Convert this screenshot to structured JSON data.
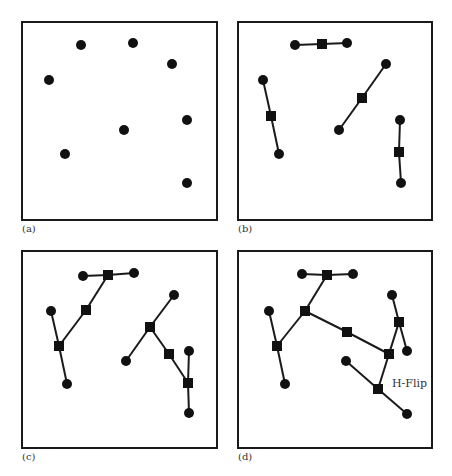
{
  "figure": {
    "panels": [
      {
        "id": "a",
        "label": "(a)",
        "box": [
          22,
          22,
          217,
          220
        ],
        "label_pos": [
          22,
          232
        ],
        "circles": [
          [
            81,
            45
          ],
          [
            133,
            43
          ],
          [
            172,
            64
          ],
          [
            49,
            80
          ],
          [
            187,
            120
          ],
          [
            124,
            130
          ],
          [
            65,
            154
          ],
          [
            187,
            183
          ]
        ],
        "squares": [],
        "edges": [],
        "annotation": null
      },
      {
        "id": "b",
        "label": "(b)",
        "box": [
          238,
          22,
          432,
          220
        ],
        "label_pos": [
          238,
          232
        ],
        "circles": [
          [
            295,
            45
          ],
          [
            347,
            43
          ],
          [
            263,
            80
          ],
          [
            279,
            154
          ],
          [
            386,
            64
          ],
          [
            339,
            130
          ],
          [
            400,
            120
          ],
          [
            401,
            183
          ]
        ],
        "squares": [
          [
            322,
            44
          ],
          [
            271,
            116
          ],
          [
            362,
            98
          ],
          [
            399,
            152
          ]
        ],
        "edges": [
          [
            [
              295,
              45
            ],
            [
              322,
              44
            ]
          ],
          [
            [
              322,
              44
            ],
            [
              347,
              43
            ]
          ],
          [
            [
              263,
              80
            ],
            [
              271,
              116
            ]
          ],
          [
            [
              271,
              116
            ],
            [
              279,
              154
            ]
          ],
          [
            [
              386,
              64
            ],
            [
              362,
              98
            ]
          ],
          [
            [
              362,
              98
            ],
            [
              339,
              130
            ]
          ],
          [
            [
              400,
              120
            ],
            [
              399,
              152
            ]
          ],
          [
            [
              399,
              152
            ],
            [
              401,
              183
            ]
          ]
        ],
        "annotation": null
      },
      {
        "id": "c",
        "label": "(c)",
        "box": [
          22,
          251,
          217,
          448
        ],
        "label_pos": [
          22,
          460
        ],
        "circles": [
          [
            83,
            276
          ],
          [
            134,
            273
          ],
          [
            51,
            311
          ],
          [
            67,
            384
          ],
          [
            174,
            295
          ],
          [
            126,
            361
          ],
          [
            189,
            351
          ],
          [
            189,
            413
          ]
        ],
        "squares": [
          [
            108,
            275
          ],
          [
            86,
            310
          ],
          [
            59,
            346
          ],
          [
            150,
            327
          ],
          [
            169,
            354
          ],
          [
            188,
            383
          ]
        ],
        "edges": [
          [
            [
              83,
              276
            ],
            [
              108,
              275
            ]
          ],
          [
            [
              108,
              275
            ],
            [
              134,
              273
            ]
          ],
          [
            [
              108,
              275
            ],
            [
              86,
              310
            ]
          ],
          [
            [
              86,
              310
            ],
            [
              59,
              346
            ]
          ],
          [
            [
              51,
              311
            ],
            [
              59,
              346
            ]
          ],
          [
            [
              59,
              346
            ],
            [
              67,
              384
            ]
          ],
          [
            [
              174,
              295
            ],
            [
              150,
              327
            ]
          ],
          [
            [
              150,
              327
            ],
            [
              126,
              361
            ]
          ],
          [
            [
              150,
              327
            ],
            [
              169,
              354
            ]
          ],
          [
            [
              169,
              354
            ],
            [
              188,
              383
            ]
          ],
          [
            [
              189,
              351
            ],
            [
              188,
              383
            ]
          ],
          [
            [
              188,
              383
            ],
            [
              189,
              413
            ]
          ]
        ],
        "annotation": null
      },
      {
        "id": "d",
        "label": "(d)",
        "box": [
          238,
          251,
          432,
          448
        ],
        "label_pos": [
          238,
          460
        ],
        "circles": [
          [
            302,
            274
          ],
          [
            353,
            274
          ],
          [
            269,
            311
          ],
          [
            285,
            384
          ],
          [
            392,
            295
          ],
          [
            407,
            351
          ],
          [
            346,
            361
          ],
          [
            407,
            414
          ]
        ],
        "squares": [
          [
            327,
            275
          ],
          [
            305,
            311
          ],
          [
            277,
            346
          ],
          [
            347,
            332
          ],
          [
            389,
            354
          ],
          [
            399,
            322
          ],
          [
            378,
            389
          ]
        ],
        "edges": [
          [
            [
              302,
              274
            ],
            [
              327,
              275
            ]
          ],
          [
            [
              327,
              275
            ],
            [
              353,
              274
            ]
          ],
          [
            [
              327,
              275
            ],
            [
              305,
              311
            ]
          ],
          [
            [
              305,
              311
            ],
            [
              277,
              346
            ]
          ],
          [
            [
              269,
              311
            ],
            [
              277,
              346
            ]
          ],
          [
            [
              277,
              346
            ],
            [
              285,
              384
            ]
          ],
          [
            [
              305,
              311
            ],
            [
              347,
              332
            ]
          ],
          [
            [
              347,
              332
            ],
            [
              389,
              354
            ]
          ],
          [
            [
              392,
              295
            ],
            [
              399,
              322
            ]
          ],
          [
            [
              399,
              322
            ],
            [
              407,
              351
            ]
          ],
          [
            [
              399,
              322
            ],
            [
              389,
              354
            ]
          ],
          [
            [
              389,
              354
            ],
            [
              378,
              389
            ]
          ],
          [
            [
              346,
              361
            ],
            [
              378,
              389
            ]
          ],
          [
            [
              378,
              389
            ],
            [
              407,
              414
            ]
          ]
        ],
        "annotation": {
          "text": "H-Flip",
          "pos": [
            392,
            387
          ]
        }
      }
    ],
    "colors": {
      "stroke": "#1a1a1a",
      "fill": "#111111",
      "label": "#333333"
    },
    "circle_radius": 5,
    "square_size": 10
  }
}
